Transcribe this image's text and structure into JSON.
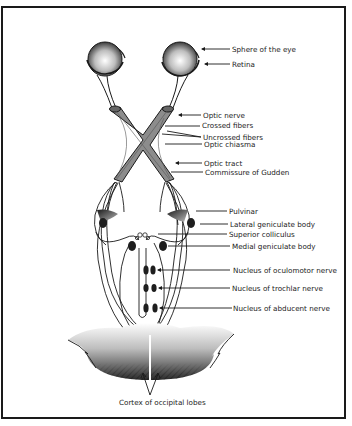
{
  "diagram": {
    "labels": {
      "sphere_of_eye": "Sphere of the eye",
      "retina": "Retina",
      "optic_nerve": "Optic nerve",
      "crossed_fibers": "Crossed fibers",
      "uncrossed_fibers": "Uncrossed fibers",
      "optic_chiasma": "Optic chiasma",
      "optic_tract": "Optic tract",
      "commissure_gudden": "Commissure of Gudden",
      "pulvinar": "Pulvinar",
      "lateral_geniculate": "Lateral geniculate body",
      "superior_colliculus": "Superior colliculus",
      "medial_geniculate": "Medial geniculate body",
      "nucleus_oculomotor": "Nucleus of oculomotor nerve",
      "nucleus_trochlar": "Nucleus of trochlar nerve",
      "nucleus_abducent": "Nucleus of abducent nerve",
      "cortex_occipital": "Cortex of occipital lobes"
    },
    "colors": {
      "line": "#1a1a1a",
      "tract_fill": "#8c8c8c",
      "nucleus_fill": "#1e1e1e"
    }
  }
}
